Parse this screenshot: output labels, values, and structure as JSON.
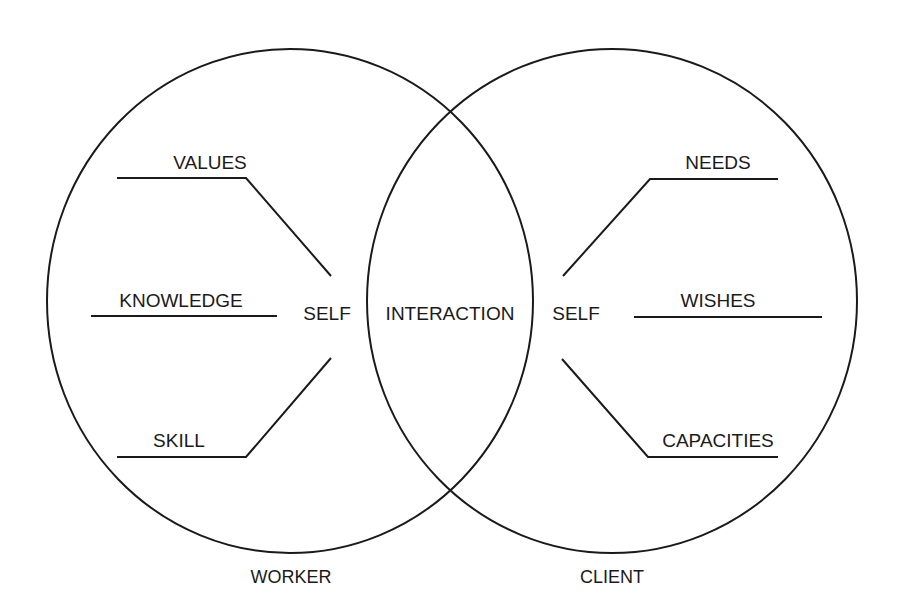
{
  "diagram": {
    "type": "venn",
    "stroke_color": "#1a1a1a",
    "background": "#ffffff",
    "circles": [
      {
        "id": "worker",
        "label": "WORKER",
        "center_label": "SELF"
      },
      {
        "id": "client",
        "label": "CLIENT",
        "center_label": "SELF"
      }
    ],
    "overlap_label": "INTERACTION",
    "worker": {
      "caption": "WORKER",
      "self": "SELF",
      "attributes": [
        "VALUES",
        "KNOWLEDGE",
        "SKILL"
      ]
    },
    "client": {
      "caption": "CLIENT",
      "self": "SELF",
      "attributes": [
        "NEEDS",
        "WISHES",
        "CAPACITIES"
      ]
    },
    "interaction": "INTERACTION"
  }
}
